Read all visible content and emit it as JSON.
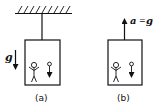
{
  "diagram": {
    "panels": [
      {
        "id": "a",
        "caption": "(a)",
        "support": "ceiling",
        "field_label": "g",
        "field_direction": "down",
        "occupants": [
          "person",
          "falling-ball"
        ]
      },
      {
        "id": "b",
        "caption": "(b)",
        "support": "none",
        "accel_label_left": "a",
        "accel_label_eq": "=",
        "accel_label_right": "g",
        "accel_direction": "up",
        "occupants": [
          "person",
          "falling-ball"
        ]
      }
    ]
  }
}
